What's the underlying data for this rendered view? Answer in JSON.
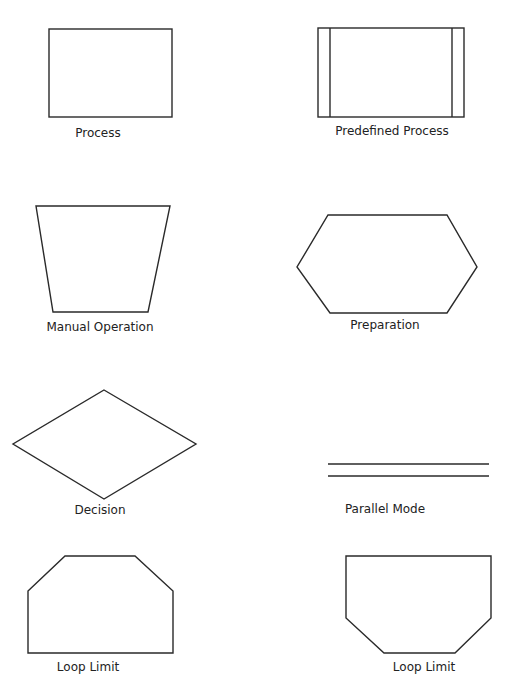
{
  "diagram": {
    "stroke_color": "#2a2a2a",
    "symbols": [
      {
        "id": "process",
        "label": "Process",
        "shape": "rectangle"
      },
      {
        "id": "predefined-process",
        "label": "Predefined Process",
        "shape": "rectangle-with-side-bars"
      },
      {
        "id": "manual-operation",
        "label": "Manual Operation",
        "shape": "trapezoid"
      },
      {
        "id": "preparation",
        "label": "Preparation",
        "shape": "hexagon"
      },
      {
        "id": "decision",
        "label": "Decision",
        "shape": "diamond"
      },
      {
        "id": "parallel-mode",
        "label": "Parallel Mode",
        "shape": "double-horizontal-lines"
      },
      {
        "id": "loop-limit-start",
        "label": "Loop Limit",
        "shape": "clipped-top-corners"
      },
      {
        "id": "loop-limit-end",
        "label": "Loop Limit",
        "shape": "clipped-bottom-corners"
      }
    ]
  }
}
